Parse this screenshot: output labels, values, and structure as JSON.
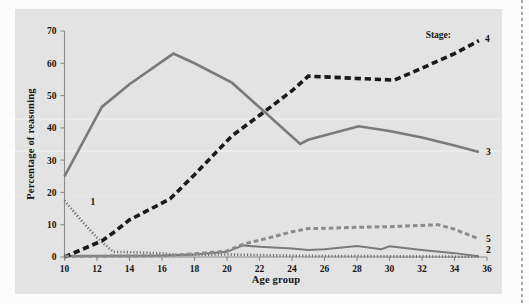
{
  "figure": {
    "background_color": "#e3e3e3",
    "page_color": "#fcfcfc"
  },
  "chart_data": {
    "type": "line",
    "title": "",
    "xlabel": "Age group",
    "ylabel": "Percentage of reasoning",
    "xlim": [
      10,
      36
    ],
    "ylim": [
      0,
      70
    ],
    "xticks": [
      10,
      12,
      14,
      16,
      18,
      20,
      22,
      24,
      26,
      28,
      30,
      32,
      34,
      36
    ],
    "yticks": [
      0,
      10,
      20,
      30,
      40,
      50,
      60,
      70
    ],
    "grid": false,
    "legend_position": "right-of-line-ends",
    "legend_caption": "Stage:",
    "series": [
      {
        "name": "1",
        "label": "1",
        "style": "dotted",
        "color": "#6e6e6e",
        "width": 2.6,
        "x": [
          10,
          11,
          12,
          13,
          14,
          16,
          17,
          18,
          20,
          22,
          24,
          26,
          28,
          30,
          32,
          34,
          35.5
        ],
        "values": [
          17.5,
          11.5,
          6.0,
          1.6,
          1.5,
          1.2,
          0.6,
          0.7,
          0.8,
          0.6,
          0.4,
          0.3,
          0.3,
          0.2,
          0.2,
          0.1,
          0.1
        ]
      },
      {
        "name": "2",
        "label": "2",
        "style": "solid",
        "color": "#7a7a7a",
        "width": 2.0,
        "x": [
          10,
          13,
          16,
          18,
          20,
          21,
          22,
          24,
          25,
          26,
          28,
          29.5,
          30,
          32,
          34,
          35.5
        ],
        "values": [
          0.3,
          0.4,
          0.5,
          0.8,
          1.6,
          3.6,
          3.2,
          2.6,
          2.2,
          2.4,
          3.4,
          2.4,
          3.3,
          2.2,
          1.2,
          0.2
        ]
      },
      {
        "name": "3",
        "label": "3",
        "style": "solid",
        "color": "#7a7a7a",
        "width": 2.6,
        "x": [
          10,
          12.3,
          14,
          16.7,
          18,
          20.3,
          22.3,
          24.5,
          25,
          28.1,
          30,
          32,
          34,
          35.5
        ],
        "values": [
          25.0,
          46.5,
          53.5,
          63.0,
          60.0,
          54.0,
          45.0,
          35.0,
          36.3,
          40.5,
          39.0,
          37.0,
          34.5,
          32.5
        ]
      },
      {
        "name": "4",
        "label": "4",
        "style": "dashed-heavy",
        "color": "#1a1a1a",
        "width": 3.6,
        "x": [
          10,
          12.3,
          13,
          14,
          16.5,
          18,
          20.3,
          22.3,
          24,
          25,
          26,
          28,
          30.3,
          32,
          34,
          35.5
        ],
        "values": [
          0.0,
          5.0,
          7.5,
          11.5,
          18.0,
          25.5,
          37.5,
          45.0,
          51.5,
          56.0,
          55.8,
          55.3,
          54.8,
          58.5,
          63.0,
          67.0
        ]
      },
      {
        "name": "5",
        "label": "5",
        "style": "dashed-medium",
        "color": "#8a8a8a",
        "width": 3.0,
        "x": [
          10,
          14,
          16.5,
          18,
          20,
          21,
          22,
          24,
          25,
          26,
          28,
          30,
          31,
          33,
          34,
          35.5
        ],
        "values": [
          0.2,
          0.3,
          0.5,
          1.0,
          1.8,
          4.0,
          5.2,
          7.8,
          8.8,
          8.9,
          9.2,
          9.4,
          9.6,
          10.0,
          8.6,
          5.6
        ]
      }
    ]
  },
  "annotations": {
    "stage_caption": "Stage:"
  }
}
